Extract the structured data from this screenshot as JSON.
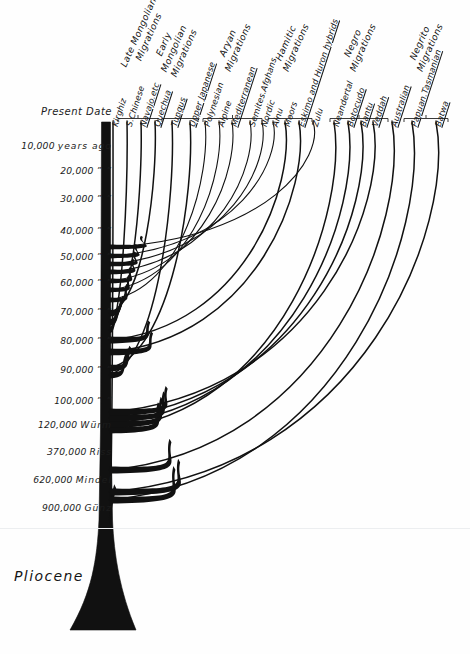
{
  "figure": {
    "epoch_label": "Pliocene",
    "ink_color": "#111111",
    "background_color": "#fefefe"
  },
  "time_axis": {
    "present_label": "Present Date",
    "rows": [
      {
        "num": "Present Date",
        "suffix": "",
        "y": 112
      },
      {
        "num": "10,000",
        "suffix": "years ago",
        "y": 146
      },
      {
        "num": "20,000",
        "suffix": "”    ”",
        "y": 171
      },
      {
        "num": "30,000",
        "suffix": "”    ”",
        "y": 199
      },
      {
        "num": "40,000",
        "suffix": "”    ”",
        "y": 231
      },
      {
        "num": "50,000",
        "suffix": "”    ”",
        "y": 257
      },
      {
        "num": "60,000",
        "suffix": "”    ”",
        "y": 283
      },
      {
        "num": "70,000",
        "suffix": "”    ”",
        "y": 312
      },
      {
        "num": "80,000",
        "suffix": "”    ”",
        "y": 341
      },
      {
        "num": "90,000",
        "suffix": "”    ”",
        "y": 370
      },
      {
        "num": "100,000",
        "suffix": "”    ”",
        "y": 401
      },
      {
        "num": "120,000",
        "suffix": "Würm",
        "y": 425
      },
      {
        "num": "370,000",
        "suffix": "Riss",
        "y": 452
      },
      {
        "num": "620,000",
        "suffix": "Mindel",
        "y": 480
      },
      {
        "num": "900,000",
        "suffix": "Günz",
        "y": 508
      }
    ]
  },
  "groups": [
    {
      "label": "Late Mongolian\nMigrations",
      "bracket_x0": 118,
      "bracket_x1": 158,
      "label_x": 138,
      "label_y": 62
    },
    {
      "label": "Early\nMongolian\nMigrations",
      "bracket_x0": 162,
      "bracket_x1": 198,
      "label_x": 178,
      "label_y": 62
    },
    {
      "label": "Aryan\nMigrations",
      "bracket_x0": 203,
      "bracket_x1": 262,
      "label_x": 232,
      "label_y": 62
    },
    {
      "label": "Hamitic\nMigrations",
      "bracket_x0": 268,
      "bracket_x1": 312,
      "label_x": 290,
      "label_y": 62
    },
    {
      "label": "Negro\nMigrations",
      "bracket_x0": 330,
      "bracket_x1": 388,
      "label_x": 357,
      "label_y": 62
    },
    {
      "label": "Negrito\nMigrations",
      "bracket_x0": 404,
      "bracket_x1": 448,
      "label_x": 424,
      "label_y": 62
    }
  ],
  "branches": [
    {
      "name": "Kirghiz",
      "tip_x": 113,
      "origin_y": 520,
      "underline": false
    },
    {
      "name": "S.Chinese",
      "tip_x": 127,
      "origin_y": 330,
      "underline": false
    },
    {
      "name": "Navajo.etc",
      "tip_x": 141,
      "origin_y": 322,
      "underline": true
    },
    {
      "name": "Quechua",
      "tip_x": 155,
      "origin_y": 313,
      "underline": true
    },
    {
      "name": "Tungus",
      "tip_x": 172,
      "origin_y": 375,
      "underline": true
    },
    {
      "name": "Upper Japanese",
      "tip_x": 190,
      "origin_y": 368,
      "underline": true
    },
    {
      "name": "Polynesian",
      "tip_x": 205,
      "origin_y": 300,
      "underline": false
    },
    {
      "name": "Alpine",
      "tip_x": 219,
      "origin_y": 290,
      "underline": false
    },
    {
      "name": "Mediterranean",
      "tip_x": 232,
      "origin_y": 281,
      "underline": true
    },
    {
      "name": "Semites.Afghans",
      "tip_x": 250,
      "origin_y": 272,
      "underline": false
    },
    {
      "name": "Nordic",
      "tip_x": 262,
      "origin_y": 264,
      "underline": false
    },
    {
      "name": "Ainu",
      "tip_x": 273,
      "origin_y": 256,
      "underline": false
    },
    {
      "name": "Moors",
      "tip_x": 285,
      "origin_y": 340,
      "underline": false
    },
    {
      "name": "Eskimo and Huron hybrids",
      "tip_x": 299,
      "origin_y": 352,
      "underline": true
    },
    {
      "name": "Zulu",
      "tip_x": 313,
      "origin_y": 247,
      "underline": false
    },
    {
      "name": "Neandertal",
      "tip_x": 334,
      "origin_y": 430,
      "underline": false
    },
    {
      "name": "Botocudo",
      "tip_x": 348,
      "origin_y": 424,
      "underline": true
    },
    {
      "name": "Bantu",
      "tip_x": 361,
      "origin_y": 418,
      "underline": true
    },
    {
      "name": "Veddah",
      "tip_x": 373,
      "origin_y": 412,
      "underline": true
    },
    {
      "name": "Australian",
      "tip_x": 392,
      "origin_y": 470,
      "underline": true
    },
    {
      "name": "Papuan.Tasmanian",
      "tip_x": 412,
      "origin_y": 500,
      "underline": true
    },
    {
      "name": "Batwa",
      "tip_x": 436,
      "origin_y": 492,
      "underline": true
    }
  ]
}
